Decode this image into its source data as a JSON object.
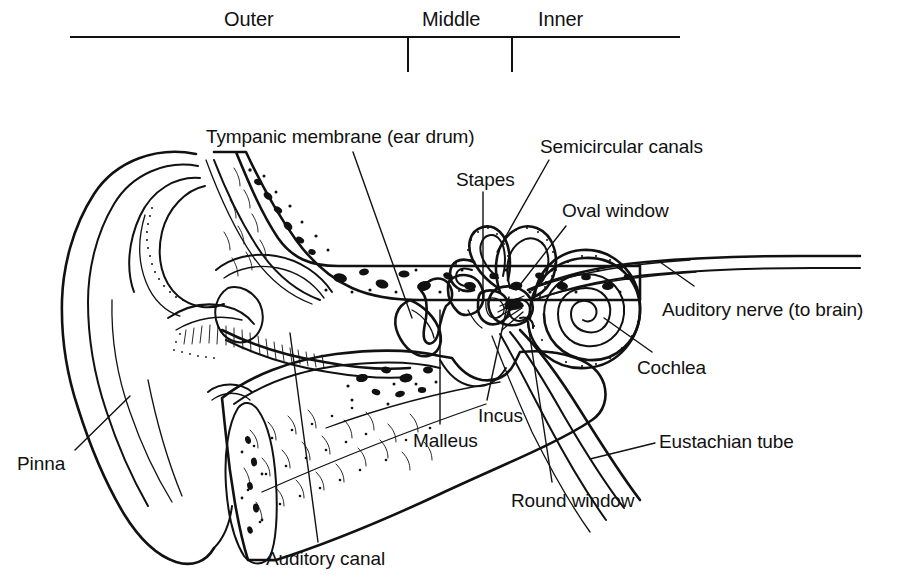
{
  "figure": {
    "background_color": "#ffffff",
    "ink_color": "#111111",
    "width": 904,
    "height": 585
  },
  "scale_bar": {
    "line": {
      "x1": 70,
      "x2": 680,
      "y": 37
    },
    "ticks": [
      {
        "x": 408,
        "y1": 37,
        "y2": 72
      },
      {
        "x": 512,
        "y1": 37,
        "y2": 72
      }
    ],
    "regions": [
      {
        "name": "outer",
        "label": "Outer",
        "x": 224,
        "y": 8
      },
      {
        "name": "middle",
        "label": "Middle",
        "x": 422,
        "y": 8
      },
      {
        "name": "inner",
        "label": "Inner",
        "x": 538,
        "y": 8
      }
    ]
  },
  "labels": [
    {
      "id": "tympanic-membrane",
      "text": "Tympanic membrane (ear drum)",
      "x": 206,
      "y": 126,
      "leader": "M 353 152 L 412 318"
    },
    {
      "id": "semicircular-canals",
      "text": "Semicircular canals",
      "x": 540,
      "y": 136,
      "leader": "M 549 160 L 497 252"
    },
    {
      "id": "stapes",
      "text": "Stapes",
      "x": 456,
      "y": 169,
      "leader": "M 483 192 L 483 298"
    },
    {
      "id": "oval-window",
      "text": "Oval window",
      "x": 562,
      "y": 200,
      "leader": "M 566 226 L 516 290"
    },
    {
      "id": "auditory-nerve",
      "text": "Auditory nerve (to brain)",
      "x": 662,
      "y": 299,
      "leader": "M 694 286 L 660 262"
    },
    {
      "id": "cochlea",
      "text": "Cochlea",
      "x": 637,
      "y": 357,
      "leader": "M 652 352 L 604 318"
    },
    {
      "id": "incus",
      "text": "Incus",
      "x": 478,
      "y": 405,
      "leader": "M 487 400 L 509 297"
    },
    {
      "id": "malleus",
      "text": "Malleus",
      "x": 413,
      "y": 430,
      "leader": "M 440 424 L 440 310"
    },
    {
      "id": "eustachian-tube",
      "text": "Eustachian tube",
      "x": 659,
      "y": 431,
      "leader": "M 655 443 L 590 459"
    },
    {
      "id": "round-window",
      "text": "Round window",
      "x": 511,
      "y": 490,
      "leader": "M 552 482 L 527 318"
    },
    {
      "id": "auditory-canal",
      "text": "Auditory canal",
      "x": 266,
      "y": 548,
      "leader": "M 318 542 L 290 333"
    },
    {
      "id": "pinna",
      "text": "Pinna",
      "x": 17,
      "y": 453,
      "leader": "M 75 450 L 130 396"
    }
  ]
}
